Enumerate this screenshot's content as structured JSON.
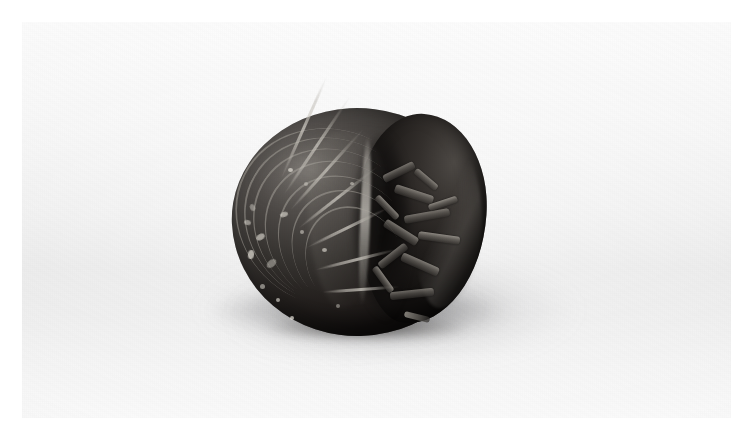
{
  "page": {
    "width": 753,
    "height": 441,
    "margin_color": "#ffffff"
  },
  "photo": {
    "x": 22,
    "y": 22,
    "width": 709,
    "height": 396,
    "palette": {
      "background_top": "#fbfbfb",
      "background_mid": "#e9e9e9",
      "background_bottom": "#fafafa",
      "shadow": "#6e6e70",
      "subject_highlight": "#d6d2ca",
      "subject_midtone": "#4f4b48",
      "subject_shadow": "#161312"
    }
  },
  "subject": {
    "name": "pillbug",
    "common_names": "pillbug / woodlouse / roly-poly",
    "pose": "conglobated (rolled into a ball)",
    "bounds": {
      "x": 232,
      "y": 108,
      "width": 258,
      "height": 232
    },
    "parts": [
      {
        "name": "dorsal-armour-dome",
        "description": "left lobe of overlapping tergite plates"
      },
      {
        "name": "curled-tail-lobe",
        "description": "right lobe curled toward the head"
      },
      {
        "name": "leg-bundle",
        "description": "tucked legs visible in the central gap"
      },
      {
        "name": "uropods",
        "description": "paired tail appendages at lower edge"
      }
    ],
    "segments": 7,
    "speckles": [
      {
        "x": 18,
        "y": 96,
        "w": 5,
        "h": 7,
        "r": -22
      },
      {
        "x": 12,
        "y": 112,
        "w": 7,
        "h": 5,
        "r": 14
      },
      {
        "x": 24,
        "y": 126,
        "w": 9,
        "h": 6,
        "r": -30
      },
      {
        "x": 16,
        "y": 142,
        "w": 6,
        "h": 9,
        "r": 8
      },
      {
        "x": 34,
        "y": 152,
        "w": 11,
        "h": 7,
        "r": -40
      },
      {
        "x": 28,
        "y": 176,
        "w": 5,
        "h": 5,
        "r": 0
      },
      {
        "x": 44,
        "y": 190,
        "w": 4,
        "h": 4,
        "r": 0
      },
      {
        "x": 56,
        "y": 60,
        "w": 5,
        "h": 4,
        "r": 0
      },
      {
        "x": 72,
        "y": 74,
        "w": 4,
        "h": 4,
        "r": 0
      },
      {
        "x": 68,
        "y": 122,
        "w": 4,
        "h": 4,
        "r": 0
      },
      {
        "x": 90,
        "y": 140,
        "w": 5,
        "h": 4,
        "r": 0
      },
      {
        "x": 58,
        "y": 208,
        "w": 4,
        "h": 4,
        "r": 0
      },
      {
        "x": 104,
        "y": 196,
        "w": 4,
        "h": 4,
        "r": 0
      },
      {
        "x": 118,
        "y": 74,
        "w": 4,
        "h": 3,
        "r": 0
      },
      {
        "x": 48,
        "y": 104,
        "w": 8,
        "h": 5,
        "r": -18
      }
    ],
    "legs": [
      {
        "x": 150,
        "y": 60,
        "w": 34,
        "h": 8,
        "r": -26
      },
      {
        "x": 162,
        "y": 82,
        "w": 40,
        "h": 9,
        "r": 18
      },
      {
        "x": 140,
        "y": 96,
        "w": 30,
        "h": 7,
        "r": 46
      },
      {
        "x": 172,
        "y": 104,
        "w": 46,
        "h": 8,
        "r": -10
      },
      {
        "x": 150,
        "y": 120,
        "w": 38,
        "h": 9,
        "r": 32
      },
      {
        "x": 186,
        "y": 126,
        "w": 42,
        "h": 8,
        "r": 8
      },
      {
        "x": 144,
        "y": 144,
        "w": 34,
        "h": 8,
        "r": -38
      },
      {
        "x": 168,
        "y": 152,
        "w": 40,
        "h": 9,
        "r": 24
      },
      {
        "x": 136,
        "y": 168,
        "w": 30,
        "h": 7,
        "r": 54
      },
      {
        "x": 158,
        "y": 182,
        "w": 44,
        "h": 8,
        "r": -6
      },
      {
        "x": 180,
        "y": 68,
        "w": 28,
        "h": 7,
        "r": 40
      },
      {
        "x": 196,
        "y": 92,
        "w": 30,
        "h": 7,
        "r": -18
      }
    ]
  },
  "surface": {
    "name": "seamless-studio-sweep",
    "shadow_direction": "lower-left",
    "lighting": "soft diffuse key from upper-left"
  }
}
